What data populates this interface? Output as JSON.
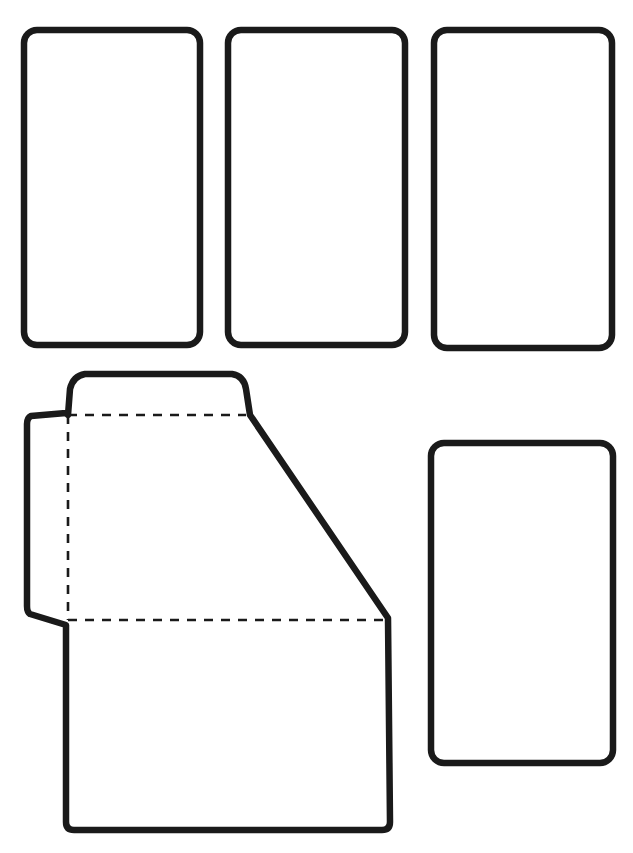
{
  "document": {
    "title": "Packaging Net Diagram",
    "background_color": "#ffffff",
    "width": 633,
    "height": 853
  },
  "style": {
    "outline_color": "#1a1a1a",
    "outline_width": 6.5,
    "fill_color": "#ffffff",
    "fold_line_color": "#1a1a1a",
    "fold_line_width": 2.6,
    "fold_dash_pattern": "9 8",
    "corner_radius_panel": 13,
    "corner_radius_flap": 8
  },
  "shapes": {
    "panels": [
      {
        "name": "panel-top-left",
        "label": "",
        "x": 24,
        "y": 30,
        "width": 176,
        "height": 315,
        "radius": 13
      },
      {
        "name": "panel-top-middle",
        "label": "",
        "x": 228,
        "y": 30,
        "width": 177,
        "height": 315,
        "radius": 13
      },
      {
        "name": "panel-top-right",
        "label": "",
        "x": 434,
        "y": 30,
        "width": 178,
        "height": 318,
        "radius": 13
      },
      {
        "name": "panel-bottom-right",
        "label": "",
        "x": 431,
        "y": 443,
        "width": 182,
        "height": 320,
        "radius": 13
      }
    ],
    "net_polygon": {
      "name": "main-net-outline",
      "label": "",
      "points": "68,415 72,388 80,375 236,375 245,387 250,415 390,620 390,824 386,830 70,830 66,824 66,625 28,612 28,418 66,413",
      "path": "M 68 415 L 70 389 Q 73 376 85 374 L 232 374 Q 244 376 246 389 L 250 415 L 388 618 L 390 822 Q 390 830 382 830 L 74 830 Q 66 830 66 822 L 66 625 L 30 614 Q 27 612 27 606 L 27 424 Q 27 418 31 416 L 66 413 Z"
    },
    "fold_lines": [
      {
        "name": "fold-line-horizontal-top",
        "x1": 68,
        "y1": 415,
        "x2": 246,
        "y2": 415
      },
      {
        "name": "fold-line-vertical-left",
        "x1": 68,
        "y1": 415,
        "x2": 68,
        "y2": 620
      },
      {
        "name": "fold-line-horizontal-bottom",
        "x1": 68,
        "y1": 620,
        "x2": 388,
        "y2": 620
      }
    ]
  }
}
